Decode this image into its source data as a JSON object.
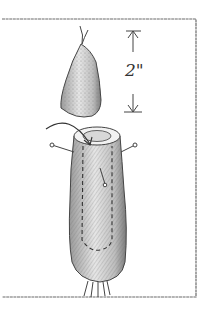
{
  "illustration": {
    "subject": "carrot hollowed with toothpicks",
    "measurement_label": "2\"",
    "colors": {
      "ink": "#3a3a3a",
      "shade": "#8a8a8a",
      "light_shade": "#c8c8c8",
      "paper": "#ffffff"
    }
  }
}
